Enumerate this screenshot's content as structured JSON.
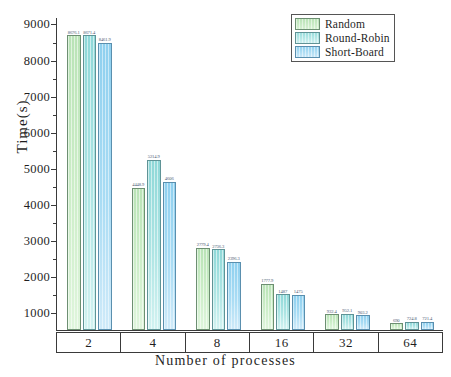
{
  "chart_data": {
    "type": "bar",
    "title": "",
    "xlabel": "Number of processes",
    "ylabel": "Time(s)",
    "categories": [
      "2",
      "4",
      "8",
      "16",
      "32",
      "64"
    ],
    "series": [
      {
        "name": "Random",
        "color": "#cdeec9",
        "values": [
          8676.1,
          4448.9,
          2779.4,
          1777.9,
          932.4,
          690.0
        ],
        "labels": [
          "8676.1",
          "4448.9",
          "2779.4",
          "1777.9",
          "932.4",
          "690"
        ]
      },
      {
        "name": "Round-Robin",
        "color": "#aee5e4",
        "values": [
          8671.4,
          5214.9,
          2736.3,
          1487.0,
          952.1,
          724.8
        ],
        "labels": [
          "8671.4",
          "5214.9",
          "2736.3",
          "1487",
          "952.1",
          "724.8"
        ]
      },
      {
        "name": "Short-Board",
        "color": "#a9dcf4",
        "values": [
          8461.9,
          4606.0,
          2396.3,
          1475.0,
          903.2,
          721.4
        ],
        "labels": [
          "8461.9",
          "4606",
          "2396.3",
          "1475",
          "903.2",
          "721.4"
        ]
      }
    ],
    "yticks": [
      1000,
      2000,
      3000,
      4000,
      5000,
      6000,
      7000,
      8000,
      9000
    ],
    "ylim": [
      500,
      9180
    ],
    "grid": false,
    "legend_position": "top-right",
    "legend_entries": [
      "Random",
      "Round-Robin",
      "Short-Board"
    ]
  }
}
